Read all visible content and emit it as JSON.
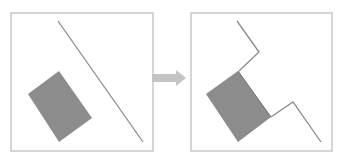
{
  "diagram": {
    "colors": {
      "frame": "#c8c8c8",
      "line": "#8a8a8a",
      "shape": "#8c8c8c",
      "arrow": "#c4c4c4",
      "background": "#ffffff"
    },
    "panels": [
      {
        "id": "before",
        "frame": {
          "x": 11,
          "y": 13,
          "w": 142,
          "h": 138
        },
        "line": {
          "x1": 58,
          "y1": 21,
          "x2": 143,
          "y2": 142
        },
        "rectangle": "28,94 59,71 92,118 59,142"
      },
      {
        "id": "after",
        "frame": {
          "x": 191,
          "y": 13,
          "w": 141,
          "h": 138
        },
        "path_upper": "237,21 259,52 239,71",
        "path_lower": "271,117 293,102 321,142",
        "rectangle": "206,94 238,71 271,117 238,142"
      }
    ],
    "arrow": {
      "direction": "right",
      "x": 152,
      "y": 72,
      "w": 34,
      "h": 12
    }
  }
}
